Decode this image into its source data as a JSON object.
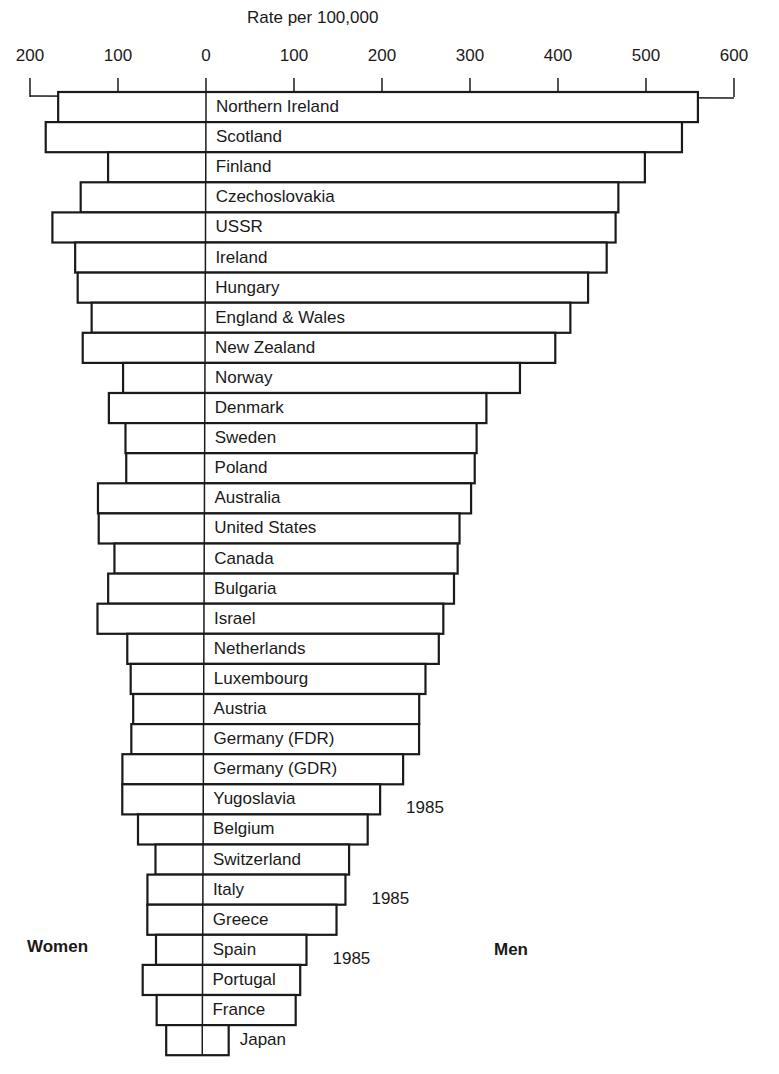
{
  "chart_data": {
    "type": "bar",
    "orientation": "horizontal",
    "layout": "back-to-back (population-pyramid style)",
    "title": "",
    "xlabel": "Rate per 100,000",
    "ylabel": "",
    "left_side_label": "Women",
    "right_side_label": "Men",
    "x_ticks_left": [
      "200",
      "100"
    ],
    "x_ticks_right": [
      "0",
      "100",
      "200",
      "300",
      "400",
      "500",
      "600"
    ],
    "xlim_women": [
      0,
      200
    ],
    "xlim_men": [
      0,
      600
    ],
    "grid": false,
    "legend": null,
    "categories": [
      "Northern Ireland",
      "Scotland",
      "Finland",
      "Czechoslovakia",
      "USSR",
      "Ireland",
      "Hungary",
      "England & Wales",
      "New Zealand",
      "Norway",
      "Denmark",
      "Sweden",
      "Poland",
      "Australia",
      "United States",
      "Canada",
      "Bulgaria",
      "Israel",
      "Netherlands",
      "Luxembourg",
      "Austria",
      "Germany (FDR)",
      "Germany (GDR)",
      "Yugoslavia",
      "Belgium",
      "Switzerland",
      "Italy",
      "Greece",
      "Spain",
      "Portugal",
      "France",
      "Japan"
    ],
    "series": [
      {
        "name": "Women",
        "values": [
          168,
          182,
          111,
          142,
          174,
          148,
          145,
          129,
          139,
          93,
          109,
          90,
          89,
          121,
          120,
          102,
          109,
          121,
          87,
          83,
          80,
          82,
          92,
          92,
          74,
          54,
          63,
          63,
          53,
          68,
          52,
          41
        ]
      },
      {
        "name": "Men",
        "values": [
          559,
          541,
          499,
          469,
          466,
          456,
          435,
          415,
          398,
          358,
          320,
          309,
          307,
          303,
          290,
          288,
          284,
          272,
          267,
          252,
          245,
          245,
          227,
          201,
          187,
          166,
          162,
          152,
          118,
          111,
          106,
          30
        ]
      }
    ],
    "annotations": [
      {
        "category": "Yugoslavia",
        "text": "1985"
      },
      {
        "category": "Italy",
        "text": "1985"
      },
      {
        "category": "Spain",
        "text": "1985"
      }
    ]
  },
  "labels": {
    "axis_title": "Rate per 100,000",
    "women": "Women",
    "men": "Men"
  }
}
